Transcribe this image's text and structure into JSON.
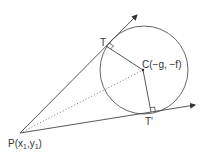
{
  "diagram": {
    "title": "",
    "labels": {
      "point_p": "P",
      "point_p_coords": "(x",
      "point_p_sub1": "1",
      "point_p_comma": ",y",
      "point_p_sub2": "1",
      "point_p_close": ")",
      "point_t": "T",
      "point_c": "C(−g, −f)",
      "point_t_prime": "T'"
    },
    "elements": {
      "circle": {
        "center": [
          144,
          70
        ],
        "radius": 44
      },
      "point_p": [
        20,
        133
      ],
      "point_t": [
        106,
        46
      ],
      "point_c": [
        143,
        70
      ],
      "point_t_prime": [
        151,
        112
      ],
      "tangent_upper_end": [
        137,
        15
      ],
      "tangent_lower_end": [
        195,
        105
      ]
    },
    "colors": {
      "line": "#444444",
      "dotted": "#777777",
      "text": "#333333"
    }
  }
}
